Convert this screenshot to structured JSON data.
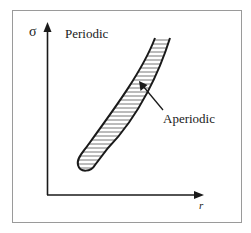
{
  "diagram": {
    "type": "phase-region-sketch",
    "axes": {
      "y_label": "σ",
      "x_label": "r"
    },
    "regions": {
      "upper_left_label": "Periodic",
      "band_label": "Aperiodic"
    },
    "colors": {
      "frame": "#9a9a9a",
      "ink": "#1a1a1a",
      "hatch": "#555555",
      "background": "#ffffff"
    }
  }
}
